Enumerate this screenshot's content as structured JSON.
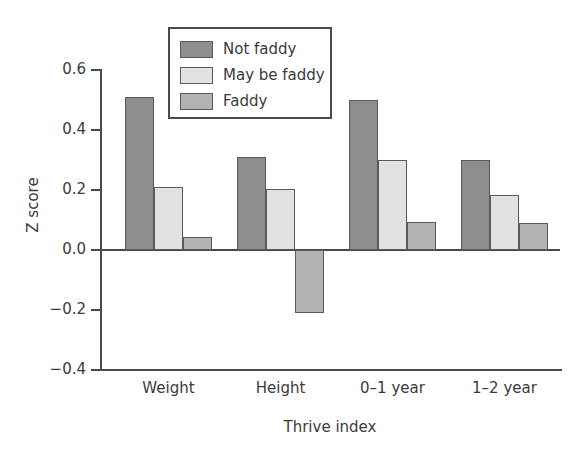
{
  "chart_data": {
    "type": "bar",
    "title": "",
    "xlabel": "Thrive index",
    "ylabel": "Z score",
    "categories": [
      "Weight",
      "Height",
      "0–1 year",
      "1–2 year"
    ],
    "series": [
      {
        "name": "Not faddy",
        "color": "#8d8d8d",
        "values": [
          0.51,
          0.31,
          0.5,
          0.3
        ]
      },
      {
        "name": "May be faddy",
        "color": "#e2e2e2",
        "values": [
          0.21,
          0.205,
          0.3,
          0.185
        ]
      },
      {
        "name": "Faddy",
        "color": "#b3b3b3",
        "values": [
          0.045,
          -0.21,
          0.095,
          0.09
        ]
      }
    ],
    "ylim": [
      -0.4,
      0.6
    ],
    "ytick_labels": [
      "0.6",
      "0.4",
      "0.2",
      "0.0",
      "−0.2",
      "−0.4"
    ],
    "ytick_values": [
      0.6,
      0.4,
      0.2,
      0.0,
      -0.2,
      -0.4
    ],
    "grid": false,
    "legend_position": "top-center",
    "axis_color": "#4a4a4a",
    "bar_border_color": "#5a5a5a",
    "background": "#ffffff"
  },
  "legend": {
    "items": [
      {
        "label": "Not faddy"
      },
      {
        "label": "May be faddy"
      },
      {
        "label": "Faddy"
      }
    ]
  }
}
